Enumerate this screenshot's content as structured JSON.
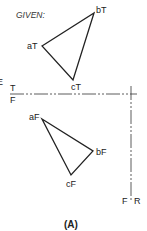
{
  "diagram": {
    "given_label": "GIVEN:",
    "caption": "(A)",
    "top_view": {
      "vertices": [
        {
          "label": "aT",
          "x": 42,
          "y": 46
        },
        {
          "label": "bT",
          "x": 94,
          "y": 13
        },
        {
          "label": "cT",
          "x": 73,
          "y": 80
        }
      ]
    },
    "front_view": {
      "vertices": [
        {
          "label": "aF",
          "x": 42,
          "y": 119
        },
        {
          "label": "bF",
          "x": 93,
          "y": 151
        },
        {
          "label": "cF",
          "x": 71,
          "y": 175
        }
      ]
    },
    "fold_lines": {
      "horizontal": {
        "top_label": "T",
        "bottom_label": "F",
        "y": 94
      },
      "vertical": {
        "left_label": "F",
        "right_label": "R",
        "x": 131
      }
    },
    "edge_label": "E",
    "colors": {
      "line": "#222222",
      "background": "#ffffff"
    }
  }
}
